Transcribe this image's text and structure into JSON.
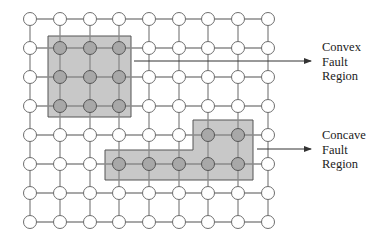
{
  "diagram": {
    "grid": {
      "cols": [
        30,
        60,
        90,
        119,
        149,
        179,
        208,
        238,
        268
      ],
      "rows": [
        19,
        48,
        77,
        106,
        135,
        164,
        193,
        222
      ],
      "node_radius": 6.5,
      "line_color": "#8a8a8a",
      "node_fill": "#ffffff",
      "node_stroke": "#6e6e6e",
      "faulty_node_fill": "#a8a8a8",
      "faulty_node_stroke": "#555555"
    },
    "regions": [
      {
        "name": "Convex Fault Region",
        "shape": "rect",
        "points": [
          [
            48,
            36
          ],
          [
            131,
            36
          ],
          [
            131,
            117
          ],
          [
            48,
            117
          ]
        ],
        "fill": "#c8c8c8",
        "stroke": "#555555",
        "faulty_nodes": [
          [
            1,
            1
          ],
          [
            2,
            1
          ],
          [
            3,
            1
          ],
          [
            1,
            2
          ],
          [
            2,
            2
          ],
          [
            3,
            2
          ],
          [
            1,
            3
          ],
          [
            2,
            3
          ],
          [
            3,
            3
          ]
        ]
      },
      {
        "name": "Concave Fault Region",
        "shape": "polygon",
        "points": [
          [
            193,
            120
          ],
          [
            253,
            120
          ],
          [
            253,
            180
          ],
          [
            105,
            180
          ],
          [
            105,
            150
          ],
          [
            193,
            150
          ]
        ],
        "fill": "#c8c8c8",
        "stroke": "#555555",
        "faulty_nodes": [
          [
            6,
            4
          ],
          [
            7,
            4
          ],
          [
            3,
            5
          ],
          [
            4,
            5
          ],
          [
            5,
            5
          ],
          [
            6,
            5
          ],
          [
            7,
            5
          ]
        ]
      }
    ],
    "arrows": [
      {
        "from": [
          134,
          61
        ],
        "to": [
          311,
          61
        ]
      },
      {
        "from": [
          257,
          149
        ],
        "to": [
          311,
          149
        ]
      }
    ],
    "labels": [
      {
        "text": "Convex\nFault\nRegion",
        "x": 322,
        "y": 40
      },
      {
        "text": "Concave\nFault\nRegion",
        "x": 322,
        "y": 128
      }
    ]
  }
}
